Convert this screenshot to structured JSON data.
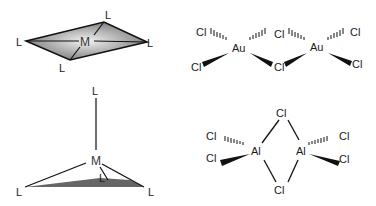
{
  "diagrams": {
    "square_planar": {
      "metal": "M",
      "ligands": [
        "L",
        "L",
        "L",
        "L"
      ],
      "fill_color": "#8a8a8a"
    },
    "au2cl6": {
      "metal_left": "Au",
      "metal_right": "Au",
      "ligands": [
        "Cl",
        "Cl",
        "Cl",
        "Cl",
        "Cl",
        "Cl"
      ]
    },
    "trigonal_pyramidal": {
      "metal": "M",
      "ligand_top": "L",
      "ligand_left": "L",
      "ligand_right": "L",
      "ligand_back": "L",
      "fill_color": "#6a6a6a"
    },
    "al2cl6": {
      "metal_left": "Al",
      "metal_right": "Al",
      "bridge_top": "Cl",
      "bridge_bottom": "Cl",
      "terminal_left_top": "Cl",
      "terminal_left_bottom": "Cl",
      "terminal_right_top": "Cl",
      "terminal_right_bottom": "Cl"
    }
  }
}
